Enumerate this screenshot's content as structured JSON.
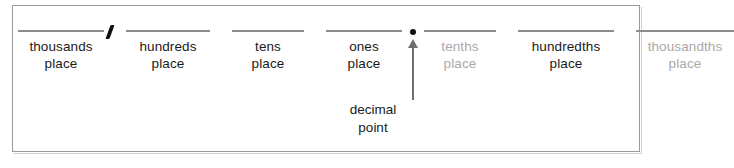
{
  "diagram": {
    "frame_border_color": "#9a9a9a",
    "background_color": "#ffffff",
    "blank_line_color": "#8c8c8c",
    "text_color": "#1a1a1a",
    "dim_text_color": "#a9a9a9",
    "mark_color": "#111111"
  },
  "separators": {
    "thousands_comma": ",",
    "decimal_point_symbol": "."
  },
  "places": [
    {
      "name": "thousands",
      "word": "thousands",
      "place": "place",
      "dim": false,
      "width": 86
    },
    {
      "name": "hundreds",
      "word": "hundreds",
      "place": "place",
      "dim": false,
      "width": 84
    },
    {
      "name": "tens",
      "word": "tens",
      "place": "place",
      "dim": false,
      "width": 72
    },
    {
      "name": "ones",
      "word": "ones",
      "place": "place",
      "dim": false,
      "width": 76
    },
    {
      "name": "tenths",
      "word": "tenths",
      "place": "place",
      "dim": true,
      "width": 72
    },
    {
      "name": "hundredths",
      "word": "hundredths",
      "place": "place",
      "dim": false,
      "width": 96
    },
    {
      "name": "thousandths",
      "word": "thousandths",
      "place": "place",
      "dim": true,
      "width": 98
    }
  ],
  "decimal_caption": {
    "line1": "decimal",
    "line2": "point"
  }
}
